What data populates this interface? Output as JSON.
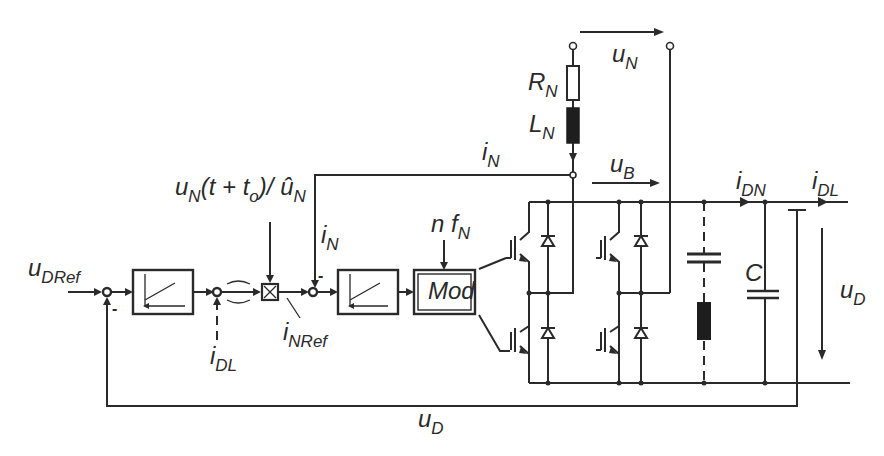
{
  "diagram": {
    "labels": {
      "u_DRef": {
        "main": "u",
        "sub": "DRef"
      },
      "i_DL_feedforward": {
        "main": "i",
        "sub": "DL"
      },
      "i_NRef": {
        "main": "i",
        "sub": "NRef"
      },
      "sync_signal": {
        "text": "u",
        "sub1": "N",
        "mid": "(t + t",
        "sub2": "o",
        "end": ")/ ",
        "hat": "û",
        "sub3": "N"
      },
      "i_N_feedback": {
        "main": "i",
        "sub": "N"
      },
      "i_N_line": {
        "main": "i",
        "sub": "N"
      },
      "n_fN": {
        "main": "n f",
        "sub": "N"
      },
      "modulator": "Mod",
      "R_N": {
        "main": "R",
        "sub": "N"
      },
      "L_N": {
        "main": "L",
        "sub": "N"
      },
      "u_N": {
        "main": "u",
        "sub": "N"
      },
      "u_B": {
        "main": "u",
        "sub": "B"
      },
      "i_DN": {
        "main": "i",
        "sub": "DN"
      },
      "i_DL_output": {
        "main": "i",
        "sub": "DL"
      },
      "C": "C",
      "u_D_right": {
        "main": "u",
        "sub": "D"
      },
      "u_D_bottom": {
        "main": "u",
        "sub": "D"
      }
    },
    "summing_signs": {
      "voltage_loop": "-",
      "current_loop": "-"
    },
    "blocks": [
      {
        "name": "voltage-controller",
        "type": "PI controller"
      },
      {
        "name": "bandpass-filter",
        "type": "filter"
      },
      {
        "name": "multiplier",
        "type": "multiplier"
      },
      {
        "name": "current-controller",
        "type": "PI controller"
      },
      {
        "name": "modulator",
        "type": "PWM modulator"
      },
      {
        "name": "igbt-bridge",
        "type": "H-bridge, 4 IGBTs with antiparallel diodes"
      },
      {
        "name": "series-resonant-filter",
        "type": "LC branch (dashed, optional)"
      },
      {
        "name": "dc-link-capacitor",
        "type": "capacitor"
      }
    ]
  }
}
